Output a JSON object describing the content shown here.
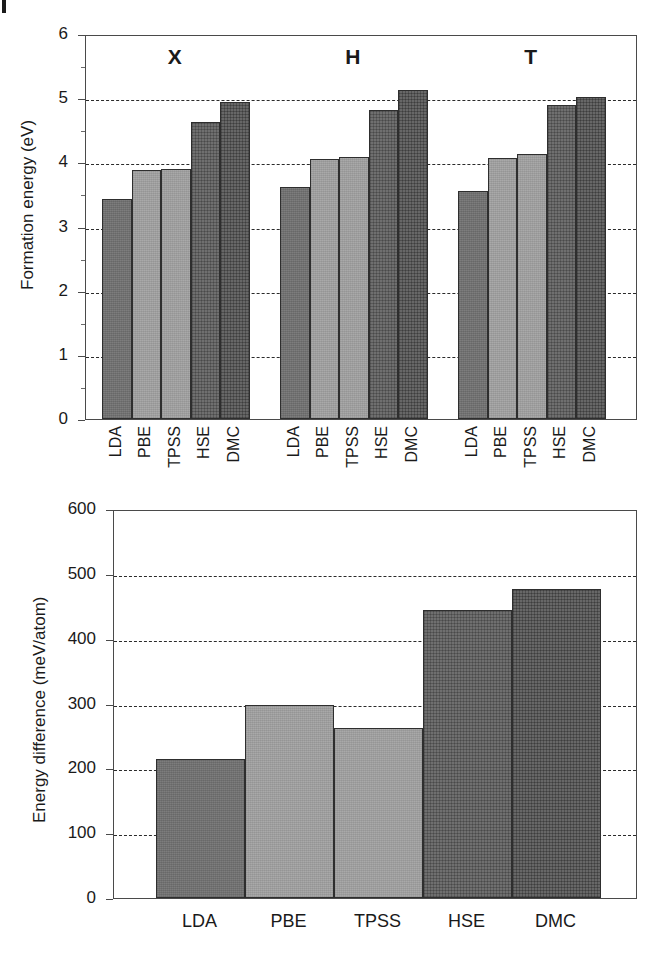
{
  "chart_data": [
    {
      "type": "bar",
      "title": "",
      "xlabel": "",
      "ylabel": "Formation energy (eV)",
      "ylim": [
        0,
        6
      ],
      "yticks": [
        "0",
        "1",
        "2",
        "3",
        "4",
        "5",
        "6"
      ],
      "ytick_values": [
        0,
        1,
        2,
        3,
        4,
        5,
        6
      ],
      "gridlines": [
        1,
        2,
        3,
        4,
        5
      ],
      "grid": true,
      "legend": "none",
      "group_labels": [
        "X",
        "H",
        "T"
      ],
      "categories": [
        "LDA",
        "PBE",
        "TPSS",
        "HSE",
        "DMC"
      ],
      "series": [
        {
          "name": "X",
          "values": [
            3.43,
            3.88,
            3.9,
            4.63,
            4.94
          ]
        },
        {
          "name": "H",
          "values": [
            3.62,
            4.05,
            4.08,
            4.81,
            5.12
          ]
        },
        {
          "name": "T",
          "values": [
            3.55,
            4.06,
            4.13,
            4.9,
            5.02
          ]
        }
      ],
      "bar_styles": [
        "fill-dark",
        "fill-light",
        "fill-light",
        "fill-hatch",
        "fill-hatch2"
      ]
    },
    {
      "type": "bar",
      "title": "",
      "xlabel": "",
      "ylabel": "Energy difference (meV/atom)",
      "ylim": [
        0,
        600
      ],
      "yticks": [
        "0",
        "100",
        "200",
        "300",
        "400",
        "500",
        "600"
      ],
      "ytick_values": [
        0,
        100,
        200,
        300,
        400,
        500,
        600
      ],
      "gridlines": [
        100,
        200,
        300,
        400,
        500
      ],
      "grid": true,
      "legend": "none",
      "categories": [
        "LDA",
        "PBE",
        "TPSS",
        "HSE",
        "DMC"
      ],
      "values": [
        215,
        298,
        263,
        445,
        477
      ],
      "bar_styles": [
        "fill-dark",
        "fill-light",
        "fill-light",
        "fill-hatch",
        "fill-hatch2"
      ]
    }
  ],
  "top_chart": {
    "ylabel": "Formation energy (eV)",
    "yticks": [
      "6",
      "5",
      "4",
      "3",
      "2",
      "1",
      "0"
    ],
    "groups": [
      {
        "label": "X",
        "bars": [
          {
            "category": "LDA",
            "value": 3.43,
            "style": "fill-dark"
          },
          {
            "category": "PBE",
            "value": 3.88,
            "style": "fill-light"
          },
          {
            "category": "TPSS",
            "value": 3.9,
            "style": "fill-light"
          },
          {
            "category": "HSE",
            "value": 4.63,
            "style": "fill-hatch"
          },
          {
            "category": "DMC",
            "value": 4.94,
            "style": "fill-hatch2"
          }
        ]
      },
      {
        "label": "H",
        "bars": [
          {
            "category": "LDA",
            "value": 3.62,
            "style": "fill-dark"
          },
          {
            "category": "PBE",
            "value": 4.05,
            "style": "fill-light"
          },
          {
            "category": "TPSS",
            "value": 4.08,
            "style": "fill-light"
          },
          {
            "category": "HSE",
            "value": 4.81,
            "style": "fill-hatch"
          },
          {
            "category": "DMC",
            "value": 5.12,
            "style": "fill-hatch2"
          }
        ]
      },
      {
        "label": "T",
        "bars": [
          {
            "category": "LDA",
            "value": 3.55,
            "style": "fill-dark"
          },
          {
            "category": "PBE",
            "value": 4.06,
            "style": "fill-light"
          },
          {
            "category": "TPSS",
            "value": 4.13,
            "style": "fill-light"
          },
          {
            "category": "HSE",
            "value": 4.9,
            "style": "fill-hatch"
          },
          {
            "category": "DMC",
            "value": 5.02,
            "style": "fill-hatch2"
          }
        ]
      }
    ]
  },
  "bottom_chart": {
    "ylabel": "Energy difference (meV/atom)",
    "yticks": [
      "600",
      "500",
      "400",
      "300",
      "200",
      "100",
      "0"
    ],
    "bars": [
      {
        "category": "LDA",
        "value": 215,
        "style": "fill-dark"
      },
      {
        "category": "PBE",
        "value": 298,
        "style": "fill-light"
      },
      {
        "category": "TPSS",
        "value": 263,
        "style": "fill-light"
      },
      {
        "category": "HSE",
        "value": 445,
        "style": "fill-hatch"
      },
      {
        "category": "DMC",
        "value": 477,
        "style": "fill-hatch2"
      }
    ]
  },
  "colors": {
    "frame": "#4a4a4a",
    "grid": "#2b2b2b",
    "text": "#1a1a1a",
    "bar_dark": "#7d7d7d",
    "bar_light": "#a9a9a9",
    "bar_hatch": "#6f6f6f",
    "bar_hatch2": "#676767"
  }
}
